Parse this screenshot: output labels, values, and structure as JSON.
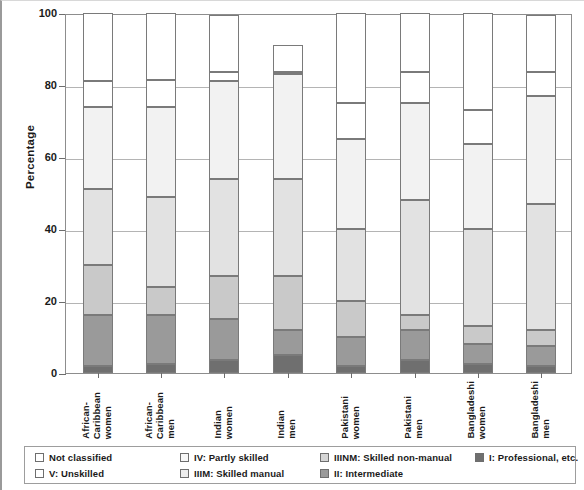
{
  "chart_data": {
    "type": "bar",
    "subtype": "stacked-column-100",
    "title": "",
    "xlabel": "",
    "ylabel": "Percentage",
    "ylim": [
      0,
      100
    ],
    "yticks": [
      0,
      20,
      40,
      60,
      80,
      100
    ],
    "grid": true,
    "legend_position": "bottom",
    "categories": [
      "African-Caribbean women",
      "African-Caribbean men",
      "Indian women",
      "Indian men",
      "Pakistani women",
      "Pakistani men",
      "Bangladeshi women",
      "Bangladeshi men"
    ],
    "category_lines": [
      [
        "African-",
        "Caribbean",
        "women"
      ],
      [
        "African-",
        "Caribbean",
        "men"
      ],
      [
        "Indian",
        "women"
      ],
      [
        "Indian",
        "men"
      ],
      [
        "Pakistani",
        "women"
      ],
      [
        "Pakistani",
        "men"
      ],
      [
        "Bangladeshi",
        "women"
      ],
      [
        "Bangladeshi",
        "men"
      ]
    ],
    "series": [
      {
        "name": "I: Professional, etc.",
        "key": "I",
        "color": "#6f6f6f",
        "values": [
          2,
          2.5,
          3.5,
          5,
          2,
          3.5,
          2.5,
          2
        ]
      },
      {
        "name": "II: Intermediate",
        "key": "II",
        "color": "#9a9a9a",
        "values": [
          14,
          13.5,
          11.5,
          7,
          8,
          8.5,
          5.5,
          5.5
        ]
      },
      {
        "name": "IIINM: Skilled non-manual",
        "key": "IIINM",
        "color": "#c9c9c9",
        "values": [
          14,
          8,
          12,
          15,
          10,
          4,
          5,
          4.5
        ]
      },
      {
        "name": "IIIM: Skilled manual",
        "key": "IIIM",
        "color": "#e2e2e2",
        "values": [
          21,
          25,
          27,
          27,
          20,
          32,
          27,
          35
        ]
      },
      {
        "name": "IV: Partly skilled",
        "key": "IV",
        "color": "#f2f2f2",
        "values": [
          23,
          25,
          27,
          29,
          25,
          27,
          23.5,
          30
        ]
      },
      {
        "name": "V: Unskilled",
        "key": "V",
        "color": "#ffffff",
        "values": [
          7,
          7.5,
          2.5,
          0.5,
          10,
          8.5,
          9.5,
          6.5
        ]
      },
      {
        "name": "Not classified",
        "key": "NC",
        "color": "#ffffff",
        "values": [
          19,
          18.5,
          16,
          7.5,
          25,
          16.5,
          27,
          16
        ]
      }
    ],
    "bar_tops": [
      81,
      89.5,
      84,
      92.5,
      75,
      83.5,
      73,
      84
    ],
    "annotations": []
  },
  "legend": {
    "columns": [
      {
        "left": 10,
        "items": [
          {
            "label": "Not classified",
            "color": "#ffffff"
          },
          {
            "label": "V: Unskilled",
            "color": "#ffffff"
          }
        ]
      },
      {
        "left": 155,
        "items": [
          {
            "label": "IV: Partly skilled",
            "color": "#f7f7f7"
          },
          {
            "label": "IIIM: Skilled manual",
            "color": "#ededed"
          }
        ]
      },
      {
        "left": 295,
        "items": [
          {
            "label": "IIINM: Skilled non-manual",
            "color": "#d5d5d5"
          },
          {
            "label": "II: Intermediate",
            "color": "#9a9a9a"
          }
        ]
      },
      {
        "left": 450,
        "items": [
          {
            "label": "I: Professional, etc.",
            "color": "#6f6f6f"
          }
        ]
      }
    ]
  },
  "axis": {
    "y_title": "Percentage",
    "y_tick_labels": [
      "100",
      "80",
      "60",
      "40",
      "20",
      "0"
    ]
  }
}
